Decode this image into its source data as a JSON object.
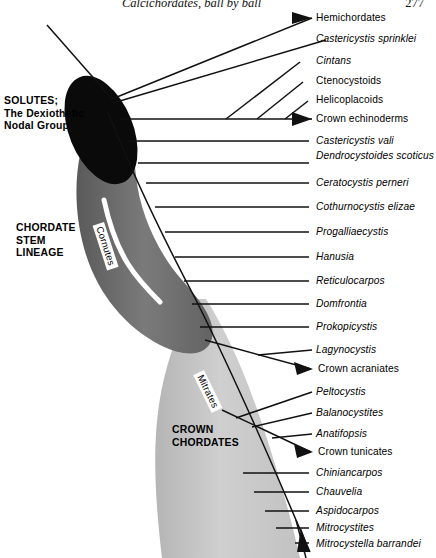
{
  "page": {
    "running_head": "Calcichordates, ball by ball",
    "page_number": "277"
  },
  "groups": {
    "solutes": "SOLUTES;\nThe Dexiothetic\nNodal Group",
    "chordate_stem": "CHORDATE\nSTEM\nLINEAGE",
    "crown_chordates": "CROWN\nCHORDATES",
    "cornutes": "Cornutes",
    "mitrates": "Mitrates"
  },
  "colors": {
    "solute_blob": "#0a0a0a",
    "stem_band": "#6e6e6e",
    "crown_band": "#c9c9c9",
    "line": "#111111",
    "background": "#ffffff"
  },
  "taxa": [
    {
      "label": "Hemichordates",
      "italic": false,
      "y": 18,
      "arrow": true
    },
    {
      "label": "Castericystis sprinklei",
      "italic": true,
      "y": 39,
      "arrow": false
    },
    {
      "label": "Cintans",
      "italic": true,
      "y": 61,
      "arrow": false
    },
    {
      "label": "Ctenocystoids",
      "italic": false,
      "y": 81,
      "arrow": false
    },
    {
      "label": "Helicoplacoids",
      "italic": false,
      "y": 100,
      "arrow": false
    },
    {
      "label": "Crown echinoderms",
      "italic": false,
      "y": 119,
      "arrow": true
    },
    {
      "label": "Castericystis vali",
      "italic": true,
      "y": 140,
      "arrow": false
    },
    {
      "label": "Dendrocystoides scoticus",
      "italic": true,
      "y": 156,
      "arrow": false,
      "twoline": true
    },
    {
      "label": "Ceratocystis perneri",
      "italic": true,
      "y": 182,
      "arrow": false
    },
    {
      "label": "Cothurnocystis elizae",
      "italic": true,
      "y": 206,
      "arrow": false
    },
    {
      "label": "Progalliaecystis",
      "italic": true,
      "y": 231,
      "arrow": false
    },
    {
      "label": "Hanusia",
      "italic": true,
      "y": 256,
      "arrow": false
    },
    {
      "label": "Reticulocarpos",
      "italic": true,
      "y": 280,
      "arrow": false
    },
    {
      "label": "Domfrontia",
      "italic": true,
      "y": 303,
      "arrow": false
    },
    {
      "label": "Prokopicystis",
      "italic": true,
      "y": 326,
      "arrow": false
    },
    {
      "label": "Lagynocystis",
      "italic": true,
      "y": 349,
      "arrow": false
    },
    {
      "label": "Crown acraniates",
      "italic": false,
      "y": 369,
      "arrow": true
    },
    {
      "label": "Peltocystis",
      "italic": true,
      "y": 391,
      "arrow": false
    },
    {
      "label": "Balanocystites",
      "italic": true,
      "y": 412,
      "arrow": false
    },
    {
      "label": "Anatifopsis",
      "italic": true,
      "y": 433,
      "arrow": false
    },
    {
      "label": "Crown tunicates",
      "italic": false,
      "y": 452,
      "arrow": true
    },
    {
      "label": "Chiniancarpos",
      "italic": true,
      "y": 472,
      "arrow": false
    },
    {
      "label": "Chauvelia",
      "italic": true,
      "y": 492,
      "arrow": false
    },
    {
      "label": "Aspidocarpos",
      "italic": true,
      "y": 510,
      "arrow": false
    },
    {
      "label": "Mitrocystites",
      "italic": true,
      "y": 527,
      "arrow": false
    },
    {
      "label": "Mitrocystella barrandei",
      "italic": true,
      "y": 543,
      "arrow": false
    },
    {
      "label": "M'ella incipiens miloni",
      "italic": true,
      "y": 562,
      "arrow": false
    },
    {
      "label": "Placocystites forbesianus",
      "italic": true,
      "y": 578,
      "arrow": false,
      "twoline": true
    },
    {
      "label": "Crown craniates",
      "italic": false,
      "y": 601,
      "arrow": true
    }
  ]
}
